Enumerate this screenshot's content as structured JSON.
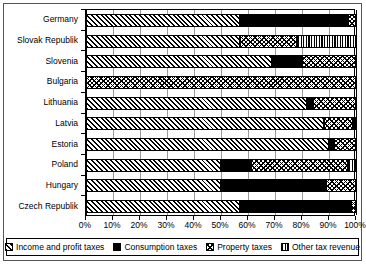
{
  "chart_data": {
    "type": "bar",
    "orientation": "horizontal",
    "stacked": true,
    "normalized": true,
    "title": "",
    "xlabel": "",
    "ylabel": "",
    "xlim": [
      0,
      100
    ],
    "grid": true,
    "legend_position": "bottom",
    "categories": [
      "Germany",
      "Slovak Republik",
      "Slovenia",
      "Bulgaria",
      "Lithuania",
      "Latvia",
      "Estoria",
      "Poland",
      "Hungary",
      "Czech Republik"
    ],
    "xticks": [
      "0%",
      "10%",
      "20%",
      "30%",
      "40%",
      "50%",
      "60%",
      "70%",
      "80%",
      "90%",
      "100%"
    ],
    "xtick_values": [
      0,
      10,
      20,
      30,
      40,
      50,
      60,
      70,
      80,
      90,
      100
    ],
    "series": [
      {
        "name": "Income and profit taxes",
        "pattern": "diagonal-hatch",
        "values": [
          57,
          57,
          69,
          0,
          82,
          88,
          90,
          50,
          50,
          57
        ]
      },
      {
        "name": "Consumption taxes",
        "pattern": "solid-black",
        "values": [
          40,
          0,
          11,
          0,
          2,
          0,
          2,
          11,
          39,
          41
        ]
      },
      {
        "name": "Property taxes",
        "pattern": "cross-dot",
        "values": [
          3,
          21,
          20,
          100,
          16,
          11,
          8,
          36,
          11,
          2
        ]
      },
      {
        "name": "Other tax revenue",
        "pattern": "vertical-stripe",
        "values": [
          0,
          22,
          0,
          0,
          0,
          1,
          0,
          3,
          0,
          0
        ]
      }
    ]
  },
  "legend": {
    "items": [
      {
        "label": "Income and profit taxes",
        "swatch": "diagonal-hatch-swatch"
      },
      {
        "label": "Consumption taxes",
        "swatch": "solid-black-swatch"
      },
      {
        "label": "Property taxes",
        "swatch": "cross-dot-swatch"
      },
      {
        "label": "Other tax revenue",
        "swatch": "vertical-stripe-swatch"
      }
    ]
  }
}
